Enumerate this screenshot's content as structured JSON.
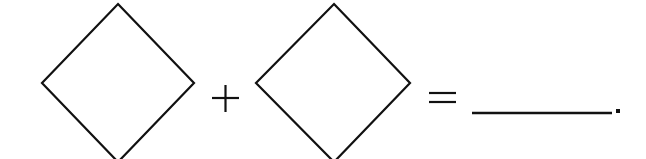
{
  "expression": {
    "operands": [
      {
        "shape": "diamond",
        "value": ""
      },
      {
        "shape": "diamond",
        "value": ""
      }
    ],
    "operator": "+",
    "equals": "=",
    "answer_blank": "",
    "terminator": "."
  },
  "colors": {
    "stroke": "#111111",
    "background": "#ffffff"
  }
}
